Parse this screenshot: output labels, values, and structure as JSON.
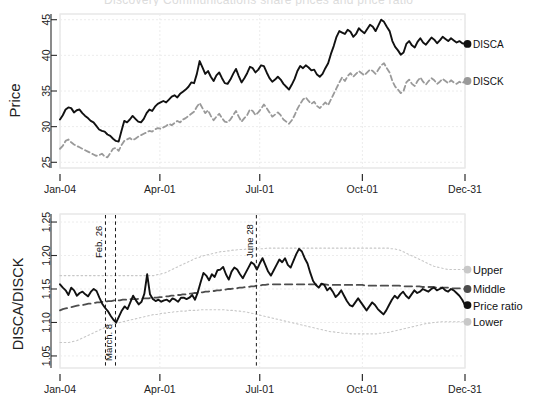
{
  "figure": {
    "cut_off_title": "Discovery Communications share prices and price ratio",
    "panels": [
      "price-panel",
      "ratio-panel"
    ]
  },
  "chart_data": [
    {
      "type": "line",
      "title": "",
      "xlabel": "",
      "ylabel": "Price",
      "grid": true,
      "legend_position": "right",
      "xlim": [
        "Jan-04",
        "Dec-31"
      ],
      "xticks": [
        "Jan-04",
        "Apr-01",
        "Jul-01",
        "Oct-01",
        "Dec-31"
      ],
      "xtick_positions": [
        0,
        0.2466,
        0.4932,
        0.7466,
        1.0
      ],
      "ylim": [
        24.2,
        45.8
      ],
      "yticks": [
        25,
        30,
        35,
        40,
        45
      ],
      "end_markers": [
        {
          "label": "DISCA",
          "value": 41.6,
          "color": "#111111"
        },
        {
          "label": "DISCK",
          "value": 36.4,
          "color": "#9a9a9a"
        }
      ],
      "series": [
        {
          "name": "DISCA",
          "color": "#111111",
          "style": "solid",
          "values": [
            31.0,
            31.6,
            32.4,
            32.7,
            32.6,
            32.0,
            32.3,
            32.4,
            31.9,
            31.5,
            31.2,
            30.8,
            30.6,
            30.1,
            29.6,
            29.4,
            29.3,
            28.9,
            28.7,
            28.3,
            28.0,
            27.9,
            29.4,
            30.8,
            30.6,
            31.0,
            31.5,
            31.1,
            30.7,
            30.6,
            31.1,
            31.9,
            32.4,
            32.2,
            32.8,
            33.2,
            33.4,
            33.6,
            33.4,
            33.8,
            34.2,
            34.4,
            34.1,
            34.6,
            34.9,
            35.2,
            35.6,
            36.2,
            36.1,
            37.4,
            39.2,
            38.3,
            37.4,
            37.8,
            37.0,
            36.4,
            37.2,
            37.6,
            36.8,
            36.1,
            36.0,
            36.6,
            37.4,
            38.1,
            37.1,
            36.2,
            36.8,
            37.5,
            38.4,
            38.2,
            37.6,
            38.0,
            38.6,
            38.5,
            37.6,
            36.8,
            36.3,
            36.6,
            37.0,
            36.6,
            36.0,
            35.6,
            35.2,
            35.9,
            36.7,
            37.8,
            38.5,
            38.2,
            38.6,
            38.3,
            37.9,
            38.0,
            37.3,
            37.0,
            37.4,
            38.2,
            38.9,
            40.2,
            41.3,
            42.6,
            43.4,
            43.2,
            43.0,
            43.6,
            43.3,
            42.6,
            43.0,
            43.8,
            43.4,
            43.1,
            43.7,
            44.3,
            44.0,
            43.4,
            44.2,
            45.0,
            44.7,
            44.0,
            43.4,
            42.0,
            41.2,
            40.7,
            40.1,
            40.4,
            41.6,
            42.0,
            41.4,
            41.1,
            41.9,
            42.4,
            41.8,
            41.5,
            42.0,
            42.5,
            42.2,
            41.7,
            42.1,
            42.6,
            42.3,
            42.0,
            42.4,
            42.1,
            41.8,
            42.0,
            41.7,
            41.6
          ]
        },
        {
          "name": "DISCK",
          "color": "#9a9a9a",
          "style": "dashed",
          "values": [
            26.9,
            27.3,
            28.0,
            28.2,
            27.8,
            27.5,
            27.3,
            27.1,
            26.9,
            26.7,
            26.5,
            26.3,
            26.1,
            25.9,
            26.0,
            26.2,
            25.8,
            25.7,
            26.3,
            26.9,
            27.0,
            26.6,
            27.4,
            28.0,
            28.2,
            28.4,
            28.1,
            28.3,
            28.6,
            28.8,
            29.0,
            29.2,
            29.4,
            29.3,
            29.6,
            29.8,
            29.7,
            29.9,
            30.1,
            30.4,
            30.2,
            30.5,
            30.8,
            30.6,
            31.0,
            31.2,
            31.5,
            31.8,
            32.1,
            32.8,
            33.3,
            32.6,
            31.9,
            32.3,
            31.5,
            30.9,
            31.4,
            31.8,
            31.2,
            30.7,
            30.6,
            31.0,
            31.6,
            32.2,
            31.4,
            30.7,
            31.2,
            31.6,
            32.4,
            32.2,
            31.6,
            32.0,
            32.5,
            33.1,
            32.6,
            32.0,
            31.4,
            31.7,
            32.0,
            31.6,
            31.0,
            30.7,
            30.4,
            30.9,
            31.6,
            32.5,
            33.2,
            33.8,
            34.1,
            33.6,
            33.2,
            33.5,
            32.9,
            32.6,
            33.0,
            33.4,
            33.0,
            33.8,
            34.6,
            35.4,
            36.2,
            36.9,
            36.4,
            37.1,
            37.5,
            37.0,
            37.4,
            37.8,
            37.5,
            37.2,
            37.6,
            38.0,
            37.8,
            37.4,
            38.0,
            38.6,
            38.9,
            38.2,
            37.6,
            36.4,
            35.6,
            35.2,
            34.7,
            35.0,
            36.2,
            36.6,
            36.0,
            35.7,
            36.4,
            36.9,
            36.3,
            35.9,
            36.4,
            36.8,
            36.5,
            36.0,
            36.3,
            36.7,
            36.4,
            36.1,
            36.5,
            36.2,
            36.0,
            36.3,
            36.1,
            36.4
          ]
        }
      ]
    },
    {
      "type": "line",
      "title": "",
      "xlabel": "",
      "ylabel": "DISCA/DISCK",
      "grid": true,
      "legend_position": "right",
      "xlim": [
        "Jan-04",
        "Dec-31"
      ],
      "xticks": [
        "Jan-04",
        "Apr-01",
        "Jul-01",
        "Oct-01",
        "Dec-31"
      ],
      "xtick_positions": [
        0,
        0.2466,
        0.4932,
        0.7466,
        1.0
      ],
      "ylim": [
        1.032,
        1.262
      ],
      "yticks": [
        1.05,
        1.1,
        1.15,
        1.2,
        1.25
      ],
      "annotations": [
        {
          "label": "Feb. 26",
          "x": 0.1123,
          "orientation": "vertical-dashed"
        },
        {
          "label": "March. 8",
          "x": 0.137,
          "orientation": "vertical-dashed"
        },
        {
          "label": "June 28",
          "x": 0.4849,
          "orientation": "vertical-dashed"
        }
      ],
      "end_markers": [
        {
          "label": "Upper",
          "value": 1.179,
          "color": "#c8c8c8"
        },
        {
          "label": "Middle",
          "value": 1.15,
          "color": "#4d4d4d"
        },
        {
          "label": "Price ratio",
          "value": 1.126,
          "color": "#111111"
        },
        {
          "label": "Lower",
          "value": 1.101,
          "color": "#c8c8c8"
        }
      ],
      "series": [
        {
          "name": "Price ratio",
          "color": "#111111",
          "style": "solid",
          "values": [
            1.157,
            1.152,
            1.148,
            1.141,
            1.152,
            1.148,
            1.14,
            1.144,
            1.146,
            1.142,
            1.139,
            1.146,
            1.15,
            1.147,
            1.137,
            1.128,
            1.122,
            1.117,
            1.11,
            1.104,
            1.1,
            1.109,
            1.118,
            1.124,
            1.12,
            1.13,
            1.14,
            1.133,
            1.127,
            1.131,
            1.143,
            1.172,
            1.142,
            1.135,
            1.132,
            1.134,
            1.131,
            1.133,
            1.134,
            1.131,
            1.136,
            1.134,
            1.131,
            1.137,
            1.137,
            1.135,
            1.137,
            1.141,
            1.134,
            1.145,
            1.16,
            1.174,
            1.17,
            1.163,
            1.172,
            1.168,
            1.178,
            1.179,
            1.183,
            1.172,
            1.164,
            1.176,
            1.182,
            1.179,
            1.172,
            1.166,
            1.174,
            1.182,
            1.19,
            1.187,
            1.179,
            1.188,
            1.196,
            1.186,
            1.176,
            1.17,
            1.178,
            1.186,
            1.194,
            1.19,
            1.196,
            1.186,
            1.182,
            1.192,
            1.202,
            1.21,
            1.206,
            1.196,
            1.188,
            1.174,
            1.162,
            1.156,
            1.152,
            1.158,
            1.156,
            1.148,
            1.152,
            1.146,
            1.138,
            1.142,
            1.148,
            1.14,
            1.132,
            1.126,
            1.124,
            1.13,
            1.136,
            1.13,
            1.124,
            1.118,
            1.124,
            1.13,
            1.126,
            1.12,
            1.116,
            1.112,
            1.118,
            1.126,
            1.134,
            1.14,
            1.136,
            1.142,
            1.146,
            1.14,
            1.136,
            1.142,
            1.148,
            1.144,
            1.146,
            1.15,
            1.148,
            1.146,
            1.15,
            1.152,
            1.148,
            1.15,
            1.152,
            1.148,
            1.146,
            1.15,
            1.148,
            1.144,
            1.14,
            1.134,
            1.126
          ]
        },
        {
          "name": "Middle",
          "color": "#4d4d4d",
          "style": "long-dashed",
          "values": [
            1.118,
            1.12,
            1.121,
            1.122,
            1.123,
            1.124,
            1.125,
            1.126,
            1.126,
            1.127,
            1.128,
            1.128,
            1.129,
            1.13,
            1.13,
            1.131,
            1.131,
            1.132,
            1.132,
            1.133,
            1.133,
            1.133,
            1.134,
            1.134,
            1.134,
            1.135,
            1.135,
            1.135,
            1.136,
            1.136,
            1.136,
            1.136,
            1.137,
            1.137,
            1.137,
            1.138,
            1.138,
            1.139,
            1.139,
            1.14,
            1.14,
            1.141,
            1.141,
            1.142,
            1.142,
            1.143,
            1.143,
            1.144,
            1.144,
            1.145,
            1.145,
            1.146,
            1.146,
            1.147,
            1.147,
            1.148,
            1.148,
            1.149,
            1.149,
            1.15,
            1.15,
            1.151,
            1.151,
            1.152,
            1.152,
            1.153,
            1.153,
            1.154,
            1.154,
            1.155,
            1.155,
            1.156,
            1.156,
            1.157,
            1.157,
            1.157,
            1.157,
            1.157,
            1.157,
            1.157,
            1.157,
            1.157,
            1.157,
            1.157,
            1.157,
            1.157,
            1.157,
            1.157,
            1.157,
            1.157,
            1.157,
            1.157,
            1.157,
            1.157,
            1.156,
            1.156,
            1.156,
            1.156,
            1.156,
            1.156,
            1.156,
            1.156,
            1.156,
            1.156,
            1.156,
            1.156,
            1.156,
            1.155,
            1.155,
            1.155,
            1.155,
            1.155,
            1.155,
            1.155,
            1.155,
            1.155,
            1.155,
            1.155,
            1.155,
            1.155,
            1.154,
            1.154,
            1.154,
            1.154,
            1.154,
            1.154,
            1.154,
            1.153,
            1.153,
            1.153,
            1.153,
            1.153,
            1.152,
            1.152,
            1.152,
            1.152,
            1.152,
            1.151,
            1.151,
            1.151,
            1.151,
            1.15,
            1.15
          ]
        },
        {
          "name": "Upper",
          "color": "#c8c8c8",
          "style": "dotted",
          "values": [
            1.17,
            1.17,
            1.17,
            1.17,
            1.17,
            1.17,
            1.17,
            1.17,
            1.17,
            1.17,
            1.17,
            1.17,
            1.17,
            1.17,
            1.17,
            1.17,
            1.17,
            1.17,
            1.17,
            1.17,
            1.17,
            1.17,
            1.17,
            1.17,
            1.17,
            1.17,
            1.17,
            1.17,
            1.17,
            1.17,
            1.17,
            1.17,
            1.17,
            1.17,
            1.171,
            1.172,
            1.173,
            1.174,
            1.176,
            1.178,
            1.18,
            1.182,
            1.184,
            1.186,
            1.188,
            1.19,
            1.192,
            1.194,
            1.196,
            1.197,
            1.199,
            1.2,
            1.201,
            1.202,
            1.203,
            1.204,
            1.205,
            1.206,
            1.206,
            1.207,
            1.207,
            1.208,
            1.208,
            1.209,
            1.209,
            1.209,
            1.21,
            1.21,
            1.21,
            1.21,
            1.21,
            1.21,
            1.21,
            1.211,
            1.211,
            1.211,
            1.211,
            1.211,
            1.211,
            1.211,
            1.211,
            1.211,
            1.211,
            1.211,
            1.211,
            1.211,
            1.211,
            1.211,
            1.211,
            1.211,
            1.211,
            1.211,
            1.211,
            1.211,
            1.211,
            1.211,
            1.211,
            1.211,
            1.211,
            1.211,
            1.211,
            1.211,
            1.211,
            1.211,
            1.211,
            1.211,
            1.211,
            1.211,
            1.211,
            1.211,
            1.211,
            1.211,
            1.211,
            1.211,
            1.211,
            1.211,
            1.211,
            1.21,
            1.21,
            1.209,
            1.208,
            1.206,
            1.204,
            1.202,
            1.2,
            1.198,
            1.196,
            1.194,
            1.192,
            1.19,
            1.188,
            1.186,
            1.184,
            1.183,
            1.182,
            1.181,
            1.18,
            1.179,
            1.179,
            1.179,
            1.179,
            1.179,
            1.179,
            1.179
          ]
        },
        {
          "name": "Lower",
          "color": "#c8c8c8",
          "style": "dotted",
          "values": [
            1.07,
            1.07,
            1.07,
            1.07,
            1.071,
            1.072,
            1.073,
            1.075,
            1.077,
            1.079,
            1.081,
            1.083,
            1.085,
            1.087,
            1.089,
            1.091,
            1.093,
            1.095,
            1.096,
            1.098,
            1.099,
            1.1,
            1.101,
            1.102,
            1.103,
            1.104,
            1.105,
            1.106,
            1.107,
            1.108,
            1.109,
            1.11,
            1.111,
            1.112,
            1.112,
            1.113,
            1.114,
            1.114,
            1.115,
            1.115,
            1.116,
            1.116,
            1.117,
            1.117,
            1.117,
            1.118,
            1.118,
            1.118,
            1.118,
            1.119,
            1.119,
            1.119,
            1.119,
            1.119,
            1.119,
            1.119,
            1.119,
            1.119,
            1.119,
            1.118,
            1.118,
            1.118,
            1.117,
            1.117,
            1.116,
            1.116,
            1.115,
            1.114,
            1.113,
            1.112,
            1.111,
            1.11,
            1.109,
            1.108,
            1.107,
            1.106,
            1.105,
            1.104,
            1.103,
            1.102,
            1.101,
            1.1,
            1.099,
            1.098,
            1.097,
            1.096,
            1.095,
            1.094,
            1.093,
            1.092,
            1.091,
            1.09,
            1.089,
            1.088,
            1.087,
            1.086,
            1.086,
            1.085,
            1.085,
            1.084,
            1.084,
            1.084,
            1.083,
            1.083,
            1.083,
            1.083,
            1.083,
            1.083,
            1.083,
            1.083,
            1.083,
            1.083,
            1.084,
            1.084,
            1.085,
            1.085,
            1.086,
            1.087,
            1.088,
            1.089,
            1.09,
            1.091,
            1.092,
            1.093,
            1.094,
            1.095,
            1.096,
            1.097,
            1.098,
            1.099,
            1.099,
            1.1,
            1.1,
            1.101,
            1.101,
            1.101,
            1.101,
            1.101,
            1.101,
            1.101,
            1.101,
            1.101,
            1.101
          ]
        }
      ]
    }
  ]
}
